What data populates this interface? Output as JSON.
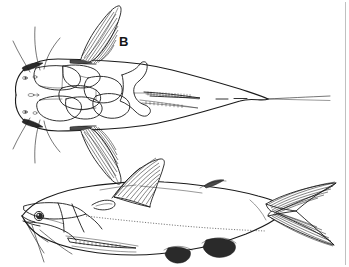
{
  "figure": {
    "medium": "black ink line drawing",
    "background_color": "#ffffff",
    "ink_color": "#1b1b1b",
    "width_px": 349,
    "height_px": 267,
    "panel_count": 2
  },
  "labels": {
    "panel_b": "B"
  },
  "panels": [
    {
      "id": "dorsal-view",
      "label": "B",
      "view": "dorsal",
      "description": "Dorsal (top-down) view of catfish head and body tapering to caudal filament",
      "features": [
        "head-plates",
        "nostrils",
        "paired-barbels",
        "left-pectoral-fin",
        "right-pectoral-fin",
        "dorsal-spine",
        "occipital-process",
        "tapering-body",
        "caudal-filament"
      ]
    },
    {
      "id": "lateral-view",
      "view": "lateral",
      "description": "Lateral (side) view of whole catfish facing left",
      "features": [
        "eye",
        "maxillary-barbel",
        "mandibular-barbels",
        "pectoral-fin-spine",
        "dorsal-fin",
        "adipose-fin",
        "pelvic-fin",
        "anal-fin",
        "lateral-line",
        "forked-caudal-fin"
      ]
    }
  ],
  "colors": {
    "ink": "#1b1b1b",
    "shadow_fill": "#2a2a2a",
    "mid_fill": "#4a4a4a",
    "rule": "#b9b9b9",
    "paper": "#ffffff"
  },
  "annotations": {
    "right_rule": "faint vertical page rule near right margin"
  }
}
